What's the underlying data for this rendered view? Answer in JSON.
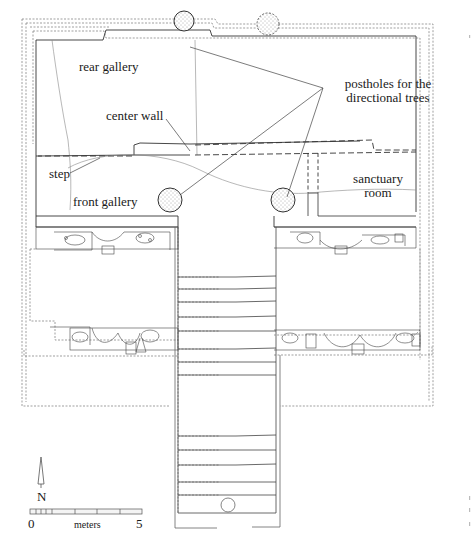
{
  "diagram": {
    "type": "architectural floor plan",
    "labels": {
      "rear_gallery": "rear gallery",
      "center_wall": "center wall",
      "step": "step",
      "front_gallery": "front gallery",
      "postholes_line1": "postholes for the",
      "postholes_line2": "directional trees",
      "sanctuary_line1": "sanctuary",
      "sanctuary_line2": "room"
    },
    "north_arrow": {
      "label": "N"
    },
    "scale_bar": {
      "start": "0",
      "end": "5",
      "unit": "meters"
    },
    "postholes": [
      {
        "name": "rear-left",
        "style": "solid"
      },
      {
        "name": "rear-right",
        "style": "dotted"
      },
      {
        "name": "front-left",
        "style": "solid"
      },
      {
        "name": "front-right",
        "style": "solid"
      }
    ],
    "stairway": {
      "steps_upper": 9,
      "steps_lower": 5
    },
    "colors": {
      "ink": "#333333",
      "light_ink": "#888888",
      "background": "#ffffff"
    }
  }
}
